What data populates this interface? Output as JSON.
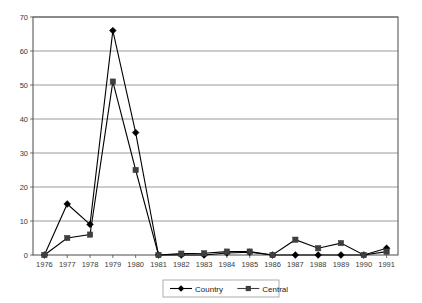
{
  "chart_data": {
    "type": "line",
    "title": "",
    "subtitle": "",
    "xlabel": "",
    "ylabel": "",
    "categories": [
      "1976",
      "1977",
      "1978",
      "1979",
      "1980",
      "1981",
      "1982",
      "1983",
      "1984",
      "1985",
      "1986",
      "1987",
      "1988",
      "1989",
      "1990",
      "1991"
    ],
    "series": [
      {
        "name": "Country",
        "marker": "diamond",
        "color": "#000000",
        "values": [
          0,
          15,
          9,
          66,
          36,
          0,
          0,
          0,
          0.6,
          0.8,
          0,
          0,
          0,
          0,
          0,
          2
        ]
      },
      {
        "name": "Central",
        "marker": "square",
        "color": "#3f3f3f",
        "values": [
          0,
          5,
          6,
          51,
          25,
          0,
          0.4,
          0.5,
          1,
          1,
          0,
          4.5,
          2,
          3.5,
          0,
          1
        ]
      }
    ],
    "ylim": [
      0,
      70
    ],
    "yticks": [
      0,
      10,
      20,
      30,
      40,
      50,
      60,
      70
    ],
    "ytick_labels": [
      "0",
      "10",
      "20",
      "30",
      "40",
      "50",
      "60",
      "70"
    ],
    "grid": true,
    "grid_axis": "y",
    "legend_position": "bottom-center",
    "legend_entries": [
      "Country",
      "Central"
    ]
  },
  "legend": {
    "items": [
      {
        "label": "Country"
      },
      {
        "label": "Central"
      }
    ]
  }
}
